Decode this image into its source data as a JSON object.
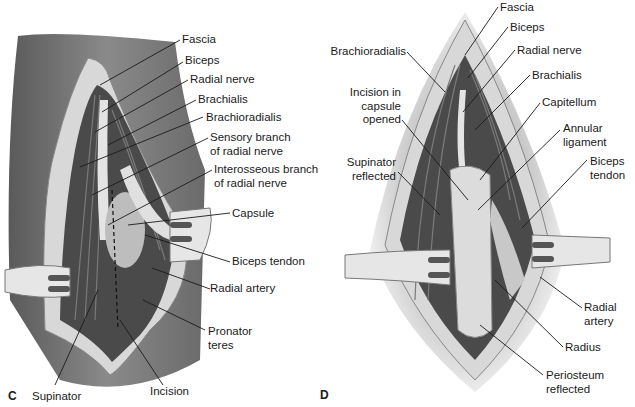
{
  "figure": {
    "panels": [
      {
        "letter": "C",
        "labels": {
          "fascia": "Fascia",
          "biceps": "Biceps",
          "radial_nerve": "Radial nerve",
          "brachialis": "Brachialis",
          "brachioradialis": "Brachioradialis",
          "sensory_1": "Sensory branch",
          "sensory_2": "of radial nerve",
          "interosseous_1": "Interosseous branch",
          "interosseous_2": "of radial nerve",
          "capsule": "Capsule",
          "biceps_tendon": "Biceps tendon",
          "radial_artery": "Radial artery",
          "pronator_1": "Pronator",
          "pronator_2": "teres",
          "incision": "Incision",
          "supinator": "Supinator"
        }
      },
      {
        "letter": "D",
        "labels": {
          "fascia": "Fascia",
          "biceps": "Biceps",
          "radial_nerve": "Radial nerve",
          "brachialis": "Brachialis",
          "brachioradialis": "Brachioradialis",
          "incision_1": "Incision in",
          "incision_2": "capsule",
          "incision_3": "opened",
          "capitellum": "Capitellum",
          "annular_1": "Annular",
          "annular_2": "ligament",
          "supinator_1": "Supinator",
          "supinator_2": "reflected",
          "biceps_tendon_1": "Biceps",
          "biceps_tendon_2": "tendon",
          "radial_artery_1": "Radial",
          "radial_artery_2": "artery",
          "radius": "Radius",
          "periosteum_1": "Periosteum",
          "periosteum_2": "reflected"
        }
      }
    ]
  }
}
